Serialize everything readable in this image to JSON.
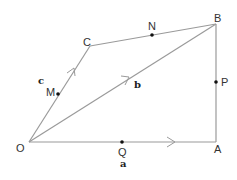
{
  "diagram": {
    "vertices": {
      "O": {
        "label": "O",
        "x": 29,
        "y": 142
      },
      "A": {
        "label": "A",
        "x": 216,
        "y": 142
      },
      "B": {
        "label": "B",
        "x": 216,
        "y": 24
      },
      "C": {
        "label": "C",
        "x": 90,
        "y": 46
      }
    },
    "points": {
      "M": {
        "label": "M",
        "on": "OC"
      },
      "N": {
        "label": "N",
        "on": "CB"
      },
      "P": {
        "label": "P",
        "on": "AB"
      },
      "Q": {
        "label": "Q",
        "on": "OA"
      }
    },
    "vectors": {
      "a": {
        "label": "a",
        "from": "O",
        "to": "A"
      },
      "b": {
        "label": "b",
        "from": "O",
        "to": "B"
      },
      "c": {
        "label": "c",
        "from": "O",
        "to": "C"
      }
    },
    "edges": [
      "OA",
      "AB",
      "BC",
      "CO",
      "OB"
    ],
    "line_color": "#9a9a9a",
    "point_color": "#111111"
  }
}
